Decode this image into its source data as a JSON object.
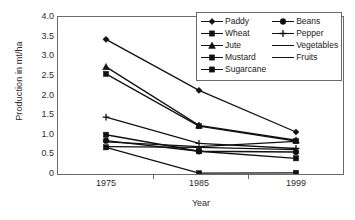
{
  "chart_data": {
    "type": "line",
    "title": "",
    "xlabel": "Year",
    "ylabel": "Production in mt/ha",
    "categories": [
      "1975",
      "1985",
      "1999"
    ],
    "x": [
      1975,
      1985,
      1999
    ],
    "ylim": [
      0,
      4.0
    ],
    "yticks": [
      "0",
      "0.5",
      "1.0",
      "1.5",
      "2.0",
      "2.5",
      "3.0",
      "3.5",
      "4.0"
    ],
    "ytick_values": [
      0,
      0.5,
      1.0,
      1.5,
      2.0,
      2.5,
      3.0,
      3.5,
      4.0
    ],
    "xticks": [
      "1975",
      "1985",
      "1999"
    ],
    "grid": false,
    "legend_position": "top-right",
    "series": [
      {
        "name": "Paddy",
        "marker": "diamond",
        "values": [
          3.43,
          2.13,
          1.07
        ]
      },
      {
        "name": "Wheat",
        "marker": "square",
        "values": [
          2.55,
          1.22,
          0.84
        ]
      },
      {
        "name": "Jute",
        "marker": "triangle",
        "values": [
          2.73,
          1.24,
          0.86
        ]
      },
      {
        "name": "Mustard",
        "marker": "square",
        "values": [
          0.68,
          0.02,
          0.03
        ]
      },
      {
        "name": "Sugarcane",
        "marker": "square",
        "values": [
          1.0,
          0.58,
          0.4
        ]
      },
      {
        "name": "Beans",
        "marker": "circle",
        "values": [
          0.85,
          0.58,
          0.56
        ]
      },
      {
        "name": "Pepper",
        "marker": "plus",
        "values": [
          1.45,
          0.78,
          0.65
        ]
      },
      {
        "name": "Vegetables",
        "marker": "none",
        "values": [
          0.7,
          0.68,
          0.62
        ]
      },
      {
        "name": "Fruits",
        "marker": "none",
        "values": [
          0.82,
          0.7,
          0.83
        ]
      }
    ]
  },
  "legend": {
    "columns": [
      [
        "Paddy",
        "Wheat",
        "Jute",
        "Mustard",
        "Sugarcane"
      ],
      [
        "Beans",
        "Pepper",
        "Vegetables",
        "Fruits"
      ]
    ]
  },
  "axes": {
    "y_title": "Production in mt/ha",
    "x_title": "Year"
  },
  "colors": {
    "line": "#111111",
    "axis": "#6a6a6a",
    "text": "#2b2b2b",
    "background": "#ffffff"
  }
}
